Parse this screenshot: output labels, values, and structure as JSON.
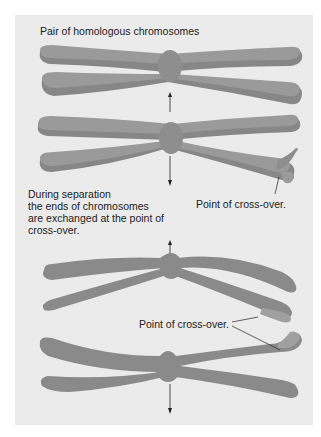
{
  "diagram": {
    "title": "Pair of homologous chromosomes",
    "explanation": {
      "line1": "During separation",
      "line2": "the ends of chromosomes",
      "line3": "are exchanged at the point of",
      "line4": "cross-over."
    },
    "crossover_label_top": "Point of cross-over.",
    "crossover_label_bottom": "Point of cross-over.",
    "colors": {
      "background": "#ebebeb",
      "chromosome_dark": "#878787",
      "chromosome_light": "#9a9a9a",
      "exchanged_segment": "#a8a8a8",
      "text": "#222222"
    }
  }
}
